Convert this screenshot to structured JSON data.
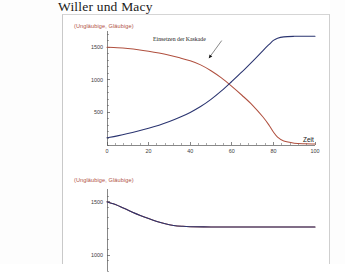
{
  "slide": {
    "title": "Willer und Macy"
  },
  "chart_data": [
    {
      "id": "cascade-chart",
      "type": "line",
      "title": "",
      "legend_label": "(Ungläubige, Gläubige)",
      "legend_position": "top-left",
      "xlabel": "Zeit",
      "ylabel": "",
      "xlim": [
        0,
        100
      ],
      "ylim": [
        0,
        1750
      ],
      "xticks": [
        0,
        20,
        40,
        60,
        80,
        100
      ],
      "xtick_labels": [
        "0",
        "20",
        "40",
        "60",
        "80",
        "100"
      ],
      "yticks": [
        500,
        1000,
        1500
      ],
      "ytick_labels": [
        "500",
        "1000",
        "1500"
      ],
      "grid": false,
      "annotations": [
        {
          "text": "Einsetzen der Kaskade",
          "x": 48,
          "y": 1290,
          "label_x": 56,
          "label_y": 1640
        }
      ],
      "series": [
        {
          "name": "Ungläubige",
          "color": "#b0503f",
          "x": [
            0,
            5,
            10,
            15,
            20,
            25,
            30,
            35,
            40,
            45,
            50,
            55,
            60,
            65,
            70,
            75,
            78,
            80,
            82,
            85,
            90,
            95,
            100
          ],
          "values": [
            1500,
            1492,
            1480,
            1463,
            1440,
            1412,
            1378,
            1338,
            1292,
            1230,
            1140,
            1030,
            900,
            760,
            610,
            430,
            300,
            200,
            120,
            60,
            28,
            18,
            14
          ]
        },
        {
          "name": "Gläubige",
          "color": "#2a3470",
          "x": [
            0,
            5,
            10,
            15,
            20,
            25,
            30,
            35,
            40,
            45,
            50,
            55,
            60,
            65,
            70,
            75,
            78,
            80,
            82,
            85,
            90,
            95,
            100
          ],
          "values": [
            110,
            140,
            175,
            215,
            258,
            305,
            360,
            425,
            500,
            590,
            700,
            830,
            975,
            1125,
            1285,
            1450,
            1545,
            1605,
            1640,
            1660,
            1668,
            1670,
            1670
          ]
        }
      ]
    },
    {
      "id": "no-cascade-chart",
      "type": "line",
      "title": "",
      "legend_label": "(Ungläubige, Gläubige)",
      "legend_position": "top-left",
      "xlabel": "",
      "ylabel": "",
      "xlim": [
        0,
        100
      ],
      "ylim": [
        850,
        1620
      ],
      "xticks": [],
      "xtick_labels": [],
      "yticks": [
        1000,
        1500
      ],
      "ytick_labels": [
        "1000",
        "1500"
      ],
      "grid": false,
      "annotations": [],
      "series": [
        {
          "name": "Ungläubige",
          "color": "#b0503f",
          "x": [
            0,
            3,
            6,
            9,
            12,
            16,
            20,
            24,
            28,
            32,
            36,
            40,
            50,
            60,
            70,
            80,
            90,
            100
          ],
          "values": [
            1500,
            1482,
            1458,
            1432,
            1405,
            1372,
            1342,
            1315,
            1293,
            1278,
            1270,
            1266,
            1264,
            1264,
            1264,
            1264,
            1264,
            1264
          ]
        },
        {
          "name": "Gläubige",
          "color": "#2a3470",
          "x": [
            0,
            3,
            6,
            9,
            12,
            16,
            20,
            24,
            28,
            32,
            36,
            40,
            50,
            60,
            70,
            80,
            90,
            100
          ],
          "values": [
            1500,
            1482,
            1458,
            1432,
            1405,
            1372,
            1342,
            1315,
            1293,
            1278,
            1270,
            1266,
            1264,
            1264,
            1264,
            1264,
            1264,
            1264
          ]
        }
      ]
    }
  ]
}
